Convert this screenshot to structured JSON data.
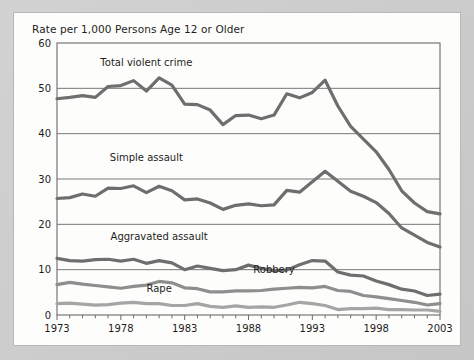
{
  "chart_data": {
    "type": "line",
    "title": "Rate per 1,000 Persons Age 12 or Older",
    "xlabel": "",
    "ylabel": "",
    "xlim": [
      1973,
      2003
    ],
    "ylim": [
      0,
      60
    ],
    "yticks": [
      0,
      10,
      20,
      30,
      40,
      50,
      60
    ],
    "xticks": [
      1973,
      1978,
      1983,
      1988,
      1993,
      1998,
      2003
    ],
    "xtick_labels": [
      "1973",
      "1978",
      "1983",
      "1988",
      "1993",
      "1998",
      "2003"
    ],
    "ytick_labels": [
      "0",
      "10",
      "20",
      "30",
      "40",
      "50",
      "60"
    ],
    "grid": "horizontal",
    "legend": "inline-annotations",
    "minor_ticks": "every year on x-axis",
    "x": [
      1973,
      1974,
      1975,
      1976,
      1977,
      1978,
      1979,
      1980,
      1981,
      1982,
      1983,
      1984,
      1985,
      1986,
      1987,
      1988,
      1989,
      1990,
      1991,
      1992,
      1993,
      1994,
      1995,
      1996,
      1997,
      1998,
      1999,
      2000,
      2001,
      2002,
      2003
    ],
    "series": [
      {
        "name": "Total violent crime",
        "color": "#6e6e6e",
        "label_x": 1980,
        "label_y": 55,
        "values": [
          47.7,
          48.0,
          48.4,
          48.0,
          50.4,
          50.6,
          51.7,
          49.4,
          52.3,
          50.7,
          46.5,
          46.4,
          45.2,
          42.0,
          44.0,
          44.1,
          43.3,
          44.1,
          48.8,
          47.9,
          49.1,
          51.8,
          46.1,
          41.6,
          38.8,
          36.0,
          32.1,
          27.4,
          24.7,
          22.8,
          22.3
        ]
      },
      {
        "name": "Simple assault",
        "color": "#6e6e6e",
        "label_x": 1980,
        "label_y": 34,
        "values": [
          25.7,
          25.9,
          26.7,
          26.2,
          28.0,
          27.9,
          28.5,
          27.0,
          28.4,
          27.4,
          25.4,
          25.6,
          24.7,
          23.3,
          24.2,
          24.5,
          24.1,
          24.3,
          27.5,
          27.1,
          29.4,
          31.7,
          29.5,
          27.3,
          26.2,
          24.8,
          22.4,
          19.2,
          17.6,
          16.0,
          15.0
        ]
      },
      {
        "name": "Aggravated assault",
        "color": "#6e6e6e",
        "label_x": 1981,
        "label_y": 16.5,
        "values": [
          12.5,
          12.0,
          11.9,
          12.2,
          12.3,
          11.9,
          12.3,
          11.4,
          12.0,
          11.5,
          10.0,
          10.8,
          10.3,
          9.8,
          10.0,
          11.0,
          10.3,
          9.8,
          9.9,
          11.1,
          12.0,
          11.9,
          9.5,
          8.8,
          8.6,
          7.5,
          6.7,
          5.7,
          5.3,
          4.3,
          4.6
        ]
      },
      {
        "name": "Robbery",
        "color": "#8e8e8e",
        "label_x": 1990,
        "label_y": 9.2,
        "values": [
          6.7,
          7.2,
          6.8,
          6.5,
          6.2,
          5.9,
          6.3,
          6.6,
          7.4,
          7.1,
          6.0,
          5.8,
          5.1,
          5.1,
          5.3,
          5.3,
          5.4,
          5.7,
          5.9,
          6.1,
          6.0,
          6.3,
          5.4,
          5.2,
          4.3,
          4.0,
          3.6,
          3.2,
          2.8,
          2.2,
          2.5
        ]
      },
      {
        "name": "Rape",
        "color": "#a5a5a5",
        "label_x": 1981,
        "label_y": 5.1,
        "values": [
          2.5,
          2.6,
          2.4,
          2.2,
          2.3,
          2.6,
          2.8,
          2.5,
          2.5,
          2.1,
          2.1,
          2.5,
          1.9,
          1.7,
          2.0,
          1.7,
          1.8,
          1.7,
          2.2,
          2.8,
          2.5,
          2.1,
          1.2,
          1.4,
          1.4,
          1.5,
          1.2,
          1.2,
          1.1,
          1.1,
          0.8
        ]
      }
    ]
  },
  "card": {
    "title": "Rate per 1,000 Persons Age 12 or Older"
  }
}
